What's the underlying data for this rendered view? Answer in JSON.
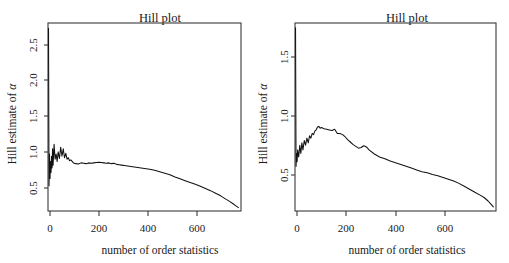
{
  "figure": {
    "background": "#ffffff",
    "line_color": "#111111",
    "axis_color": "#3a3a3a",
    "text_color": "#1a1a1a"
  },
  "chart_data": [
    {
      "type": "line",
      "panel": "left",
      "title": "Hill plot",
      "xlabel": "number of order statistics",
      "ylabel": "Hill estimate of α",
      "ylabel_plain": "Hill estimate of alpha",
      "ylabel_prefix": "Hill estimate of ",
      "ylabel_symbol": "α",
      "grid": false,
      "legend": "none",
      "xlim": [
        0,
        760
      ],
      "ylim": [
        0.28,
        2.82
      ],
      "xticks": [
        0,
        200,
        400,
        600
      ],
      "xticklabels": [
        "0",
        "200",
        "400",
        "600"
      ],
      "yticks": [
        0.5,
        1.0,
        1.5,
        2.0,
        2.5
      ],
      "yticklabels": [
        "0.5",
        "1.0",
        "1.5",
        "2.0",
        "2.5"
      ],
      "x": [
        2,
        4,
        6,
        8,
        10,
        12,
        14,
        16,
        18,
        20,
        24,
        28,
        32,
        36,
        40,
        45,
        50,
        55,
        60,
        65,
        70,
        75,
        80,
        85,
        90,
        95,
        100,
        110,
        120,
        130,
        140,
        150,
        160,
        170,
        180,
        190,
        200,
        210,
        220,
        230,
        240,
        250,
        260,
        270,
        280,
        290,
        300,
        320,
        340,
        360,
        380,
        400,
        420,
        440,
        460,
        480,
        500,
        520,
        540,
        560,
        580,
        600,
        620,
        640,
        660,
        680,
        700,
        715,
        730,
        740,
        750
      ],
      "y": [
        2.75,
        0.62,
        1.05,
        0.72,
        0.95,
        0.8,
        1.02,
        0.86,
        1.12,
        0.9,
        1.18,
        0.98,
        1.05,
        0.95,
        1.08,
        0.99,
        1.14,
        1.02,
        1.12,
        1.0,
        1.06,
        0.98,
        1.0,
        0.96,
        0.97,
        0.95,
        0.93,
        0.92,
        0.915,
        0.93,
        0.925,
        0.92,
        0.93,
        0.925,
        0.93,
        0.935,
        0.94,
        0.935,
        0.93,
        0.925,
        0.93,
        0.92,
        0.925,
        0.91,
        0.905,
        0.9,
        0.895,
        0.885,
        0.875,
        0.865,
        0.855,
        0.845,
        0.83,
        0.81,
        0.79,
        0.77,
        0.74,
        0.715,
        0.69,
        0.665,
        0.64,
        0.615,
        0.585,
        0.555,
        0.52,
        0.485,
        0.44,
        0.41,
        0.375,
        0.35,
        0.325
      ],
      "features": {
        "initial_spike_peak": 2.75,
        "initial_trough": 0.62,
        "plateau_level": 0.93,
        "final_value": 0.325
      }
    },
    {
      "type": "line",
      "panel": "right",
      "title": "Hill plot",
      "xlabel": "number of order statistics",
      "ylabel": "Hill estimate of α",
      "ylabel_plain": "Hill estimate of alpha",
      "ylabel_prefix": "Hill estimate of ",
      "ylabel_symbol": "α",
      "grid": false,
      "legend": "none",
      "xlim": [
        0,
        760
      ],
      "ylim": [
        0.14,
        1.74
      ],
      "xticks": [
        0,
        200,
        400,
        600
      ],
      "xticklabels": [
        "0",
        "200",
        "400",
        "600"
      ],
      "yticks": [
        0.5,
        1.0,
        1.5
      ],
      "yticklabels": [
        "0.5",
        "1.0",
        "1.5"
      ],
      "x": [
        2,
        4,
        6,
        8,
        10,
        14,
        18,
        22,
        26,
        30,
        35,
        40,
        45,
        50,
        55,
        60,
        65,
        70,
        75,
        80,
        85,
        90,
        95,
        100,
        110,
        120,
        130,
        140,
        150,
        160,
        170,
        180,
        190,
        200,
        210,
        220,
        230,
        240,
        250,
        260,
        270,
        280,
        300,
        320,
        340,
        360,
        380,
        400,
        420,
        440,
        460,
        480,
        500,
        520,
        540,
        560,
        580,
        600,
        620,
        640,
        660,
        680,
        700,
        715,
        730,
        740,
        750
      ],
      "y": [
        1.7,
        0.52,
        0.63,
        0.56,
        0.66,
        0.6,
        0.7,
        0.63,
        0.72,
        0.66,
        0.74,
        0.7,
        0.76,
        0.72,
        0.78,
        0.76,
        0.8,
        0.79,
        0.82,
        0.83,
        0.855,
        0.86,
        0.845,
        0.85,
        0.84,
        0.835,
        0.83,
        0.825,
        0.835,
        0.8,
        0.8,
        0.79,
        0.77,
        0.745,
        0.725,
        0.705,
        0.69,
        0.675,
        0.68,
        0.695,
        0.685,
        0.66,
        0.625,
        0.6,
        0.585,
        0.565,
        0.55,
        0.535,
        0.52,
        0.505,
        0.49,
        0.475,
        0.465,
        0.45,
        0.44,
        0.425,
        0.41,
        0.395,
        0.375,
        0.35,
        0.325,
        0.3,
        0.275,
        0.255,
        0.225,
        0.2,
        0.175
      ],
      "features": {
        "initial_spike_peak": 1.7,
        "initial_trough": 0.52,
        "peak_level": 0.86,
        "peak_location": 90,
        "secondary_bump": 0.695,
        "final_value": 0.175
      }
    }
  ]
}
